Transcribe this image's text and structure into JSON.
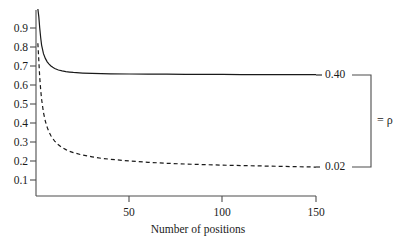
{
  "chart_data": {
    "type": "line",
    "title": "",
    "subtitle": "",
    "xlabel": "Number of positions",
    "ylabel": "",
    "xlim": [
      0,
      150
    ],
    "ylim": [
      0,
      1.0
    ],
    "grid": false,
    "legend_position": "right-inline",
    "x_ticks": [
      {
        "value": 50,
        "label": "50"
      },
      {
        "value": 100,
        "label": "100"
      },
      {
        "value": 150,
        "label": "150"
      }
    ],
    "y_ticks": [
      {
        "value": 0.1,
        "label": "0.1"
      },
      {
        "value": 0.2,
        "label": "0.2"
      },
      {
        "value": 0.3,
        "label": "0.3"
      },
      {
        "value": 0.4,
        "label": "0.4"
      },
      {
        "value": 0.5,
        "label": "0.5"
      },
      {
        "value": 0.6,
        "label": "0.6"
      },
      {
        "value": 0.7,
        "label": "0.7"
      },
      {
        "value": 0.8,
        "label": "0.8"
      },
      {
        "value": 0.9,
        "label": "0.9"
      }
    ],
    "series": [
      {
        "name": "0.40",
        "style": "solid",
        "color": "#1a1a1a",
        "end_label": "0.40",
        "asymptote": 0.655,
        "x": [
          1,
          1.5,
          2,
          2.5,
          3,
          4,
          5,
          6,
          7,
          8,
          9,
          10,
          12,
          14,
          16,
          18,
          20,
          25,
          30,
          35,
          40,
          50,
          60,
          70,
          80,
          90,
          100,
          110,
          120,
          130,
          140,
          150
        ],
        "values": [
          1.0,
          0.96,
          0.9,
          0.85,
          0.81,
          0.765,
          0.74,
          0.722,
          0.71,
          0.7,
          0.693,
          0.687,
          0.679,
          0.674,
          0.67,
          0.668,
          0.666,
          0.663,
          0.661,
          0.66,
          0.659,
          0.658,
          0.657,
          0.657,
          0.656,
          0.656,
          0.656,
          0.655,
          0.655,
          0.655,
          0.655,
          0.655
        ]
      },
      {
        "name": "0.02",
        "style": "dashed",
        "color": "#1a1a1a",
        "end_label": "0.02",
        "asymptote": 0.168,
        "x": [
          1,
          1.5,
          2,
          2.5,
          3,
          4,
          5,
          6,
          7,
          8,
          9,
          10,
          12,
          14,
          16,
          18,
          20,
          25,
          30,
          35,
          40,
          50,
          60,
          70,
          80,
          90,
          100,
          110,
          120,
          130,
          140,
          150
        ],
        "values": [
          0.82,
          0.73,
          0.64,
          0.575,
          0.525,
          0.455,
          0.41,
          0.377,
          0.352,
          0.333,
          0.318,
          0.305,
          0.285,
          0.271,
          0.26,
          0.251,
          0.244,
          0.231,
          0.222,
          0.214,
          0.209,
          0.2,
          0.193,
          0.188,
          0.184,
          0.181,
          0.178,
          0.176,
          0.174,
          0.172,
          0.17,
          0.168
        ]
      }
    ],
    "annotations": [
      {
        "name": "bracket-label",
        "text": "= ρ"
      }
    ]
  }
}
